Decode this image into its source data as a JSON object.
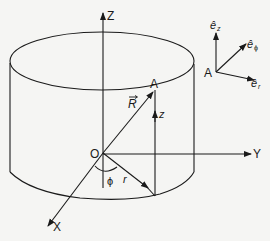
{
  "figure": {
    "type": "cylindrical-coordinate-system",
    "axes": {
      "x_label": "X",
      "y_label": "Y",
      "z_label": "Z"
    },
    "origin_label": "O",
    "point_label": "A",
    "position_vector_label": "R",
    "height_label": "z",
    "radius_label": "r",
    "angle_label": "ϕ",
    "unit_vectors": {
      "origin_label": "A",
      "e_z": "ê",
      "e_z_sub": "z",
      "e_phi": "ê",
      "e_phi_sub": "ϕ",
      "e_r": "ê",
      "e_r_sub": "r"
    }
  },
  "colors": {
    "stroke": "#1a1a1a",
    "background": "#f5f5f3"
  }
}
